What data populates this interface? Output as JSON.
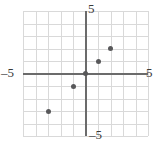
{
  "figure": {
    "background_color": "#ffffff",
    "grid_color": "#d9d9d9",
    "axis_color": "#6b6b6b",
    "point_color": "#58585a"
  },
  "labels": {
    "y_top": "5",
    "y_bottom": "–5",
    "x_left": "–5",
    "x_right": "5"
  },
  "chart_data": {
    "type": "scatter",
    "title": "",
    "xlabel": "",
    "ylabel": "",
    "xlim": [
      -5,
      5
    ],
    "ylim": [
      -5,
      5
    ],
    "xticks": [
      -5,
      5
    ],
    "yticks": [
      -5,
      5
    ],
    "xtick_labels": [
      "–5",
      "5"
    ],
    "ytick_labels": [
      "–5",
      "5"
    ],
    "grid": true,
    "grid_step": 1,
    "legend": null,
    "series": [
      {
        "name": "points",
        "marker": "circle",
        "color": "#58585a",
        "points": [
          {
            "x": -3,
            "y": -3
          },
          {
            "x": -1,
            "y": -1
          },
          {
            "x": 0,
            "y": 0
          },
          {
            "x": 1,
            "y": 1
          },
          {
            "x": 2,
            "y": 2
          }
        ]
      }
    ]
  }
}
